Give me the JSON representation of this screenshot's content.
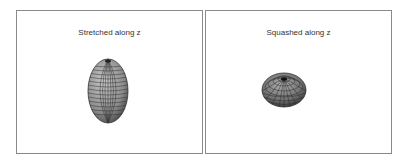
{
  "panels": [
    {
      "id": "stretched",
      "title": "Stretched along z",
      "shape": "prolate-spheroid",
      "center": [
        91,
        80
      ],
      "rx": 20,
      "ry": 32
    },
    {
      "id": "squashed",
      "title": "Squashed along z",
      "shape": "oblate-spheroid",
      "center": [
        78,
        79
      ],
      "rx": 22,
      "ry": 17
    }
  ],
  "colors": {
    "border": "#8a8a8a",
    "surface": "#9a9a9a",
    "mesh": "#333333",
    "background": "#ffffff"
  }
}
